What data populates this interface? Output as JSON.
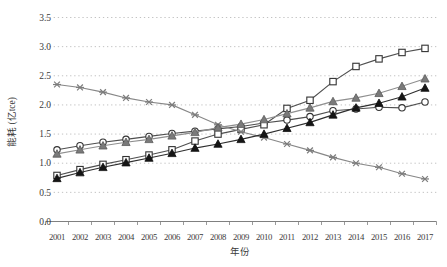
{
  "chart_data": {
    "type": "line",
    "title": "",
    "xlabel": "年份",
    "ylabel": "能耗 (亿tce)",
    "x": [
      "2001",
      "2002",
      "2003",
      "2004",
      "2005",
      "2006",
      "2007",
      "2008",
      "2009",
      "2010",
      "2011",
      "2012",
      "2013",
      "2014",
      "2015",
      "2016",
      "2017"
    ],
    "ylim": [
      0.0,
      3.5
    ],
    "ytick_step": 0.5,
    "yticks": [
      "0.0",
      "0.5",
      "1.0",
      "1.5",
      "2.0",
      "2.5",
      "3.0",
      "3.5"
    ],
    "grid": "horizontal-dotted",
    "legend": "none",
    "axis_color": "#808080",
    "grid_color": "#c2c2c2",
    "text_color": "#3a3a3a",
    "series": [
      {
        "name": "open-circle-series",
        "marker": "circle-open",
        "line_color": "#4f4f4f",
        "marker_stroke": "#333333",
        "marker_fill": "#ffffff",
        "values": [
          1.23,
          1.3,
          1.36,
          1.41,
          1.46,
          1.51,
          1.55,
          1.59,
          1.63,
          1.69,
          1.74,
          1.8,
          1.9,
          1.93,
          1.96,
          1.95,
          2.05
        ]
      },
      {
        "name": "open-square-series",
        "marker": "square-open",
        "line_color": "#4f4f4f",
        "marker_stroke": "#333333",
        "marker_fill": "#ffffff",
        "values": [
          0.79,
          0.89,
          0.98,
          1.06,
          1.14,
          1.23,
          1.38,
          1.5,
          1.58,
          1.66,
          1.94,
          2.08,
          2.4,
          2.66,
          2.79,
          2.9,
          2.97
        ]
      },
      {
        "name": "asterisk-series",
        "marker": "asterisk",
        "line_color": "#878787",
        "marker_stroke": "#7d7d7d",
        "marker_fill": "none",
        "values": [
          2.35,
          2.3,
          2.22,
          2.12,
          2.05,
          2.0,
          1.83,
          1.66,
          1.54,
          1.44,
          1.33,
          1.22,
          1.1,
          1.0,
          0.93,
          0.82,
          0.73
        ]
      },
      {
        "name": "gray-triangle-series",
        "marker": "triangle-filled",
        "line_color": "#8f8f8f",
        "marker_stroke": "#5a5a5a",
        "marker_fill": "#7a7a7a",
        "values": [
          1.16,
          1.23,
          1.3,
          1.36,
          1.41,
          1.47,
          1.53,
          1.61,
          1.67,
          1.75,
          1.85,
          1.95,
          2.06,
          2.12,
          2.2,
          2.32,
          2.45
        ]
      },
      {
        "name": "black-triangle-series",
        "marker": "triangle-filled",
        "line_color": "#2e2e2e",
        "marker_stroke": "#111111",
        "marker_fill": "#151515",
        "values": [
          0.74,
          0.84,
          0.93,
          1.01,
          1.09,
          1.17,
          1.26,
          1.33,
          1.41,
          1.5,
          1.6,
          1.7,
          1.83,
          1.95,
          2.03,
          2.14,
          2.29
        ]
      }
    ]
  }
}
